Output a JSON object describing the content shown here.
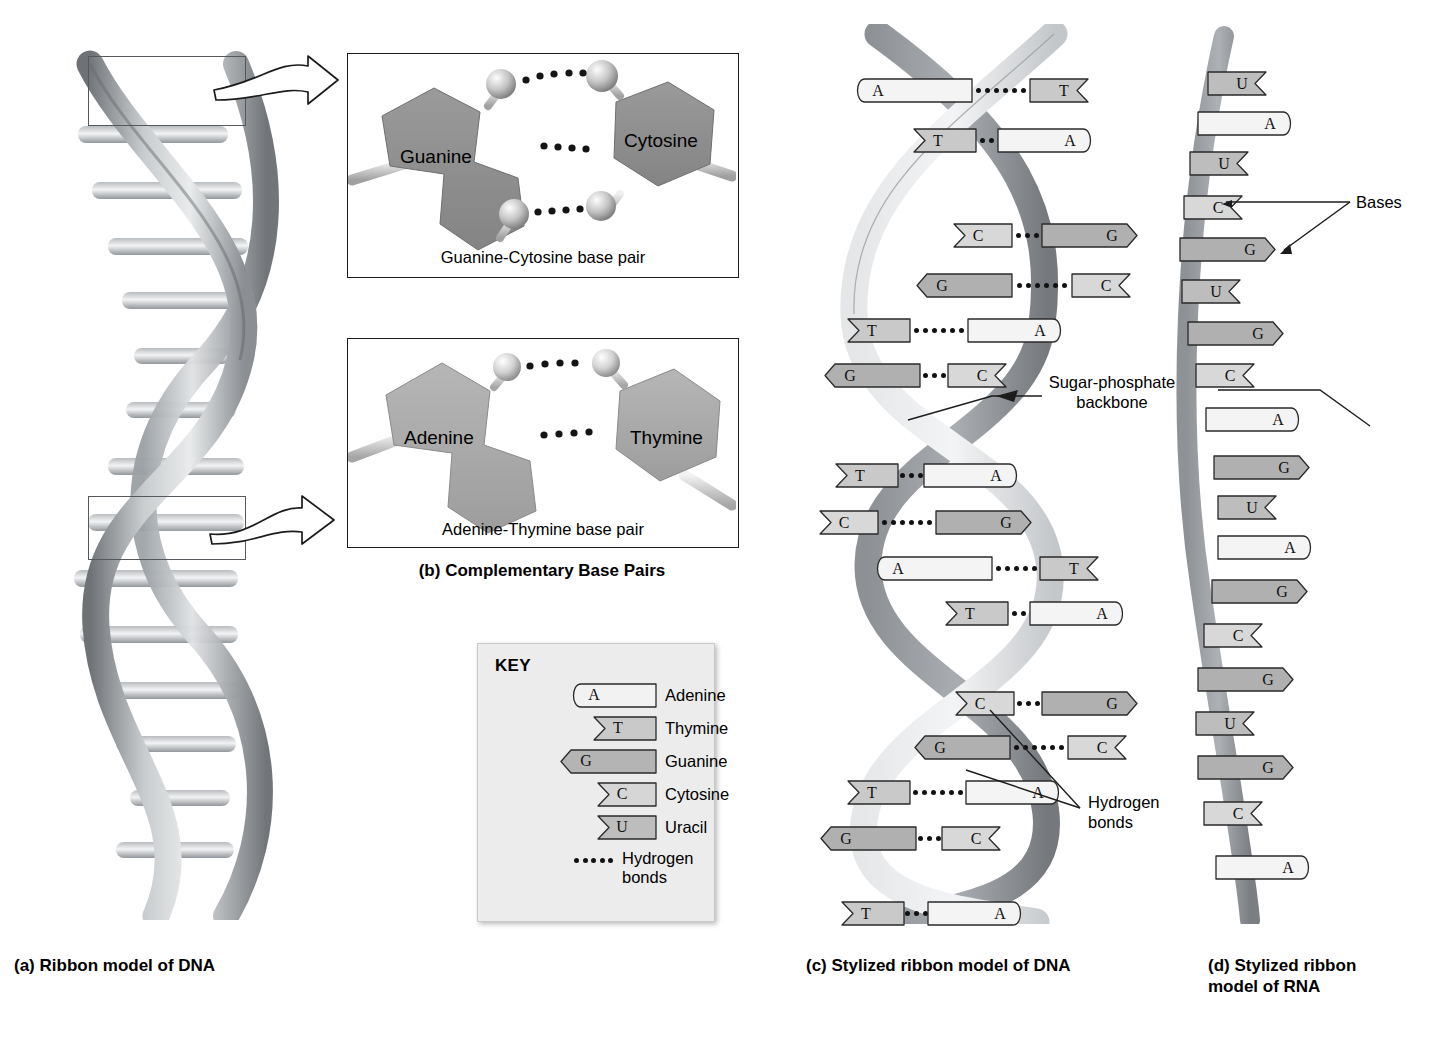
{
  "figure": {
    "captions": {
      "a": "(a) Ribbon model of DNA",
      "b": "(b) Complementary Base Pairs",
      "c": "(c) Stylized ribbon model of DNA",
      "d": "(d) Stylized ribbon\nmodel of RNA"
    }
  },
  "panel_b": {
    "gc": {
      "left_base": "Guanine",
      "right_base": "Cytosine",
      "caption": "Guanine-Cytosine base pair",
      "hydrogen_bonds": 3
    },
    "at": {
      "left_base": "Adenine",
      "right_base": "Thymine",
      "caption": "Adenine-Thymine base pair",
      "hydrogen_bonds": 2
    }
  },
  "key": {
    "title": "KEY",
    "entries": [
      {
        "letter": "A",
        "label": "Adenine",
        "shape": "round-notch",
        "fill": "#f2f2f2",
        "width": 86
      },
      {
        "letter": "T",
        "label": "Thymine",
        "shape": "v-notch",
        "fill": "#c9c9c9",
        "width": 62
      },
      {
        "letter": "G",
        "label": "Guanine",
        "shape": "point-notch",
        "fill": "#b4b4b4",
        "width": 96
      },
      {
        "letter": "C",
        "label": "Cytosine",
        "shape": "v-notch",
        "fill": "#d6d6d6",
        "width": 58
      },
      {
        "letter": "U",
        "label": "Uracil",
        "shape": "v-notch",
        "fill": "#bdbdbd",
        "width": 58
      }
    ],
    "hydrogen_bonds_label": "Hydrogen\nbonds",
    "hydrogen_bonds_dots": 5
  },
  "annotations": {
    "sugar_phosphate": "Sugar-phosphate\nbackbone",
    "bases": "Bases",
    "hydrogen_bonds": "Hydrogen\nbonds"
  },
  "panel_c": {
    "title": "Stylized ribbon model of DNA",
    "base_pairs": [
      {
        "left": "A",
        "right": "T",
        "bonds": 6,
        "y": 55,
        "x": 48,
        "lw": 118,
        "gap": 58
      },
      {
        "left": "T",
        "right": "A",
        "bonds": 2,
        "y": 105,
        "x": 108,
        "lw": 62,
        "gap": 22
      },
      {
        "left": "C",
        "right": "G",
        "bonds": 3,
        "y": 200,
        "x": 148,
        "lw": 58,
        "gap": 30
      },
      {
        "left": "G",
        "right": "C",
        "bonds": 6,
        "y": 250,
        "x": 110,
        "lw": 96,
        "gap": 60
      },
      {
        "left": "T",
        "right": "A",
        "bonds": 6,
        "y": 295,
        "x": 42,
        "lw": 62,
        "gap": 58
      },
      {
        "left": "G",
        "right": "C",
        "bonds": 3,
        "y": 340,
        "x": 18,
        "lw": 96,
        "gap": 28
      },
      {
        "left": "T",
        "right": "A",
        "bonds": 3,
        "y": 440,
        "x": 30,
        "lw": 62,
        "gap": 26
      },
      {
        "left": "C",
        "right": "G",
        "bonds": 6,
        "y": 487,
        "x": 14,
        "lw": 58,
        "gap": 58
      },
      {
        "left": "A",
        "right": "T",
        "bonds": 5,
        "y": 533,
        "x": 68,
        "lw": 118,
        "gap": 48
      },
      {
        "left": "T",
        "right": "A",
        "bonds": 2,
        "y": 578,
        "x": 140,
        "lw": 62,
        "gap": 22
      },
      {
        "left": "C",
        "right": "G",
        "bonds": 3,
        "y": 668,
        "x": 150,
        "lw": 58,
        "gap": 28
      },
      {
        "left": "G",
        "right": "C",
        "bonds": 6,
        "y": 712,
        "x": 108,
        "lw": 96,
        "gap": 58
      },
      {
        "left": "T",
        "right": "A",
        "bonds": 6,
        "y": 757,
        "x": 42,
        "lw": 62,
        "gap": 56
      },
      {
        "left": "G",
        "right": "C",
        "bonds": 3,
        "y": 803,
        "x": 14,
        "lw": 96,
        "gap": 26
      },
      {
        "left": "T",
        "right": "A",
        "bonds": 3,
        "y": 878,
        "x": 36,
        "lw": 62,
        "gap": 24
      }
    ]
  },
  "panel_d": {
    "title": "Stylized ribbon model of RNA",
    "bases": [
      {
        "letter": "U",
        "y": 48,
        "x": 48,
        "w": 58
      },
      {
        "letter": "A",
        "y": 88,
        "x": 38,
        "w": 96
      },
      {
        "letter": "U",
        "y": 128,
        "x": 30,
        "w": 58
      },
      {
        "letter": "C",
        "y": 172,
        "x": 24,
        "w": 58
      },
      {
        "letter": "G",
        "y": 214,
        "x": 20,
        "w": 96
      },
      {
        "letter": "U",
        "y": 256,
        "x": 22,
        "w": 58
      },
      {
        "letter": "G",
        "y": 298,
        "x": 28,
        "w": 96
      },
      {
        "letter": "C",
        "y": 340,
        "x": 36,
        "w": 58
      },
      {
        "letter": "A",
        "y": 384,
        "x": 46,
        "w": 96
      },
      {
        "letter": "G",
        "y": 432,
        "x": 54,
        "w": 96
      },
      {
        "letter": "U",
        "y": 472,
        "x": 58,
        "w": 58
      },
      {
        "letter": "A",
        "y": 512,
        "x": 58,
        "w": 96
      },
      {
        "letter": "G",
        "y": 556,
        "x": 52,
        "w": 96
      },
      {
        "letter": "C",
        "y": 600,
        "x": 44,
        "w": 58
      },
      {
        "letter": "G",
        "y": 644,
        "x": 38,
        "w": 96
      },
      {
        "letter": "U",
        "y": 688,
        "x": 36,
        "w": 58
      },
      {
        "letter": "G",
        "y": 732,
        "x": 38,
        "w": 96
      },
      {
        "letter": "C",
        "y": 778,
        "x": 44,
        "w": 58
      },
      {
        "letter": "A",
        "y": 832,
        "x": 56,
        "w": 96
      }
    ]
  }
}
